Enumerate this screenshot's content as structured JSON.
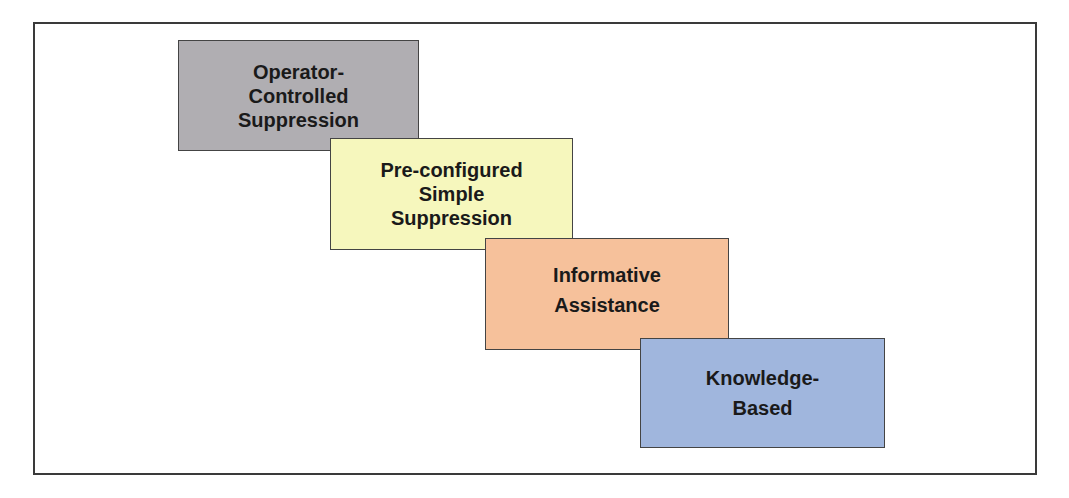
{
  "diagram": {
    "steps": [
      {
        "lines": [
          "Operator-",
          "Controlled",
          "Suppression"
        ],
        "color": "#b0aeb2"
      },
      {
        "lines": [
          "Pre-configured",
          "Simple",
          "Suppression"
        ],
        "color": "#f6f7bd"
      },
      {
        "lines": [
          "Informative",
          "Assistance"
        ],
        "color": "#f6c19b"
      },
      {
        "lines": [
          "Knowledge-",
          "Based"
        ],
        "color": "#a0b6dd"
      }
    ]
  }
}
